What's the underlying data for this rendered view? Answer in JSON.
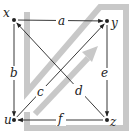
{
  "diagram": {
    "type": "commutative-diagram",
    "nodes": [
      {
        "id": "x",
        "label": "x"
      },
      {
        "id": "y",
        "label": "y"
      },
      {
        "id": "u",
        "label": "u"
      },
      {
        "id": "z",
        "label": "z"
      }
    ],
    "arrows": [
      {
        "id": "a",
        "label": "a",
        "from": "x",
        "to": "y"
      },
      {
        "id": "b",
        "label": "b",
        "from": "x",
        "to": "u"
      },
      {
        "id": "c",
        "label": "c",
        "from": "u",
        "to": "y"
      },
      {
        "id": "d",
        "label": "d",
        "from": "z",
        "to": "x"
      },
      {
        "id": "e",
        "label": "e",
        "from": "y",
        "to": "z"
      },
      {
        "id": "f",
        "label": "f",
        "from": "z",
        "to": "u"
      }
    ],
    "colors": {
      "ink": "#222222",
      "background_shape": "#c8c8c8"
    }
  }
}
